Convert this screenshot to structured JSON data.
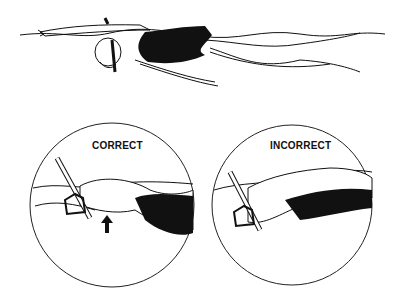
{
  "figure": {
    "top_illustration": "swimmer-with-snorkel-gliding",
    "panels": [
      {
        "label": "CORRECT",
        "indicator": "arrow-up-icon"
      },
      {
        "label": "INCORRECT"
      }
    ]
  }
}
